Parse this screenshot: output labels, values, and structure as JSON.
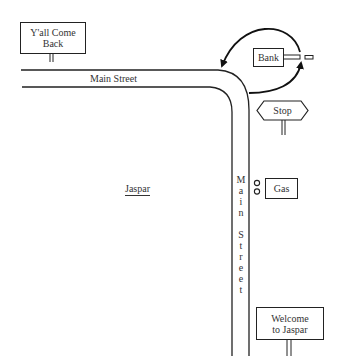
{
  "diagram": {
    "type": "street map sketch",
    "town_name": "Jaspar",
    "streets": [
      {
        "name": "Main Street",
        "orientation": "horizontal"
      },
      {
        "name": "Main Street",
        "orientation": "vertical",
        "letters": [
          "M",
          "a",
          "i",
          "n",
          "",
          "S",
          "t",
          "r",
          "e",
          "e",
          "t"
        ]
      }
    ],
    "signs": {
      "yall_come_back": {
        "line1": "Y'all Come",
        "line2": "Back"
      },
      "stop": "Stop",
      "welcome": {
        "line1": "Welcome",
        "line2": "to Jaspar"
      }
    },
    "buildings": {
      "bank": "Bank",
      "gas": "Gas"
    },
    "annotations": {
      "loop_arrow": "circular route from the bank looping back to the Main Street corner"
    },
    "colors": {
      "ink": "#222222",
      "background": "#ffffff"
    }
  }
}
